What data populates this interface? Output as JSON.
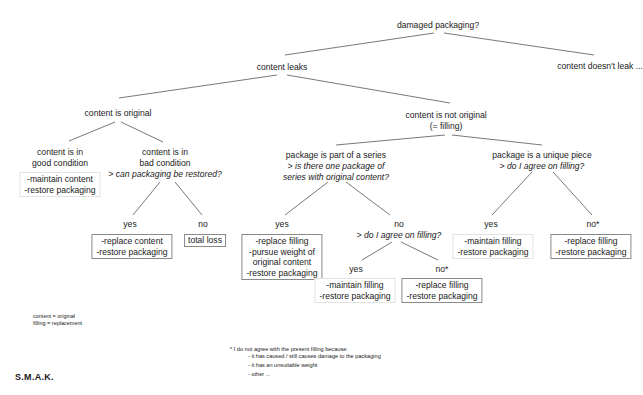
{
  "diagram": {
    "title": "damaged packaging?",
    "root": {
      "label": "damaged packaging?",
      "branches": {
        "leaks": "content leaks",
        "no_leak": "content doesn't leak ..."
      }
    },
    "content_leaks": {
      "original": {
        "label": "content is original",
        "good": {
          "label_1": "content is in",
          "label_2": "good condition",
          "action_1": "-maintain content",
          "action_2": "-restore packaging"
        },
        "bad": {
          "label_1": "content is in",
          "label_2": "bad condition",
          "question": "> can packaging be restored?",
          "yes": {
            "label": "yes",
            "action_1": "-replace content",
            "action_2": "-restore packaging"
          },
          "no": {
            "label": "no",
            "action_1": "total loss"
          }
        }
      },
      "not_original": {
        "label_1": "content is not original",
        "label_2": "(= filling)",
        "series": {
          "label": "package is part of a series",
          "question_1": "> is there one package of",
          "question_2": "series with original content?",
          "yes": {
            "label": "yes",
            "action_1": "-replace filling",
            "action_2": "-pursue weight of",
            "action_3": "original content",
            "action_4": "-restore packaging"
          },
          "no": {
            "label": "no",
            "question": "> do I agree on filling?",
            "yes": {
              "label": "yes",
              "action_1": "-maintain filling",
              "action_2": "-restore packaging"
            },
            "no": {
              "label": "no*",
              "action_1": "-replace filling",
              "action_2": "-restore packaging"
            }
          }
        },
        "unique": {
          "label": "package is a unique piece",
          "question": "> do I agree on filling?",
          "yes": {
            "label": "yes",
            "action_1": "-maintain filling",
            "action_2": "-restore packaging"
          },
          "no": {
            "label": "no*",
            "action_1": "-replace filling",
            "action_2": "-restore packaging"
          }
        }
      }
    }
  },
  "legend": {
    "line_1": "content = original",
    "line_2": "filling = replacement"
  },
  "footnote": {
    "intro": "* I do not agree with the present filling because:",
    "reasons": [
      "- it has caused / still causes damage to the packaging",
      "- it has an unsuitable weight",
      "- other ..."
    ]
  },
  "brand": "S.M.A.K."
}
